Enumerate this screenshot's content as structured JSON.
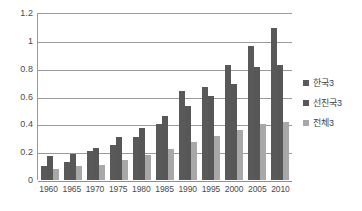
{
  "chart_data": {
    "type": "bar",
    "title": "",
    "subtitle": "",
    "xlabel": "",
    "ylabel": "",
    "ylim": [
      0,
      1.2
    ],
    "yticks": [
      "0",
      "0.2",
      "0.4",
      "0.6",
      "0.8",
      "1",
      "1.2"
    ],
    "ytick_values": [
      0,
      0.2,
      0.4,
      0.6,
      0.8,
      1,
      1.2
    ],
    "grid": true,
    "legend_position": "right",
    "categories": [
      "1960",
      "1965",
      "1970",
      "1975",
      "1980",
      "1985",
      "1990",
      "1995",
      "2000",
      "2005",
      "2010"
    ],
    "series": [
      {
        "name": "한국3",
        "color": "#595959",
        "values": [
          0.1,
          0.13,
          0.21,
          0.25,
          0.31,
          0.4,
          0.64,
          0.67,
          0.83,
          0.96,
          1.09
        ]
      },
      {
        "name": "선진국3",
        "color": "#575757",
        "values": [
          0.17,
          0.19,
          0.23,
          0.31,
          0.375,
          0.46,
          0.53,
          0.605,
          0.69,
          0.81,
          0.83
        ]
      },
      {
        "name": "전체3",
        "color": "#a8a8a8",
        "values": [
          0.08,
          0.1,
          0.11,
          0.145,
          0.18,
          0.225,
          0.27,
          0.315,
          0.36,
          0.4,
          0.42
        ]
      }
    ]
  },
  "legend": {
    "items": [
      {
        "label": "한국3",
        "color": "#595959"
      },
      {
        "label": "선진국3",
        "color": "#575757"
      },
      {
        "label": "전체3",
        "color": "#a8a8a8"
      }
    ]
  }
}
